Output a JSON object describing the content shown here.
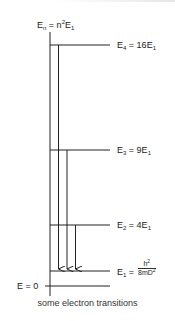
{
  "diagram": {
    "title_formula": {
      "E": "E",
      "sub": "n",
      "eq": " = n",
      "sup": "2",
      "E1": "E",
      "sub1": "1"
    },
    "levels": [
      {
        "id": "E4",
        "label_main": "E",
        "label_sub": "4",
        "label_rest": " = 16E",
        "label_sub2": "1"
      },
      {
        "id": "E3",
        "label_main": "E",
        "label_sub": "3",
        "label_rest": " = 9E",
        "label_sub2": "1"
      },
      {
        "id": "E2",
        "label_main": "E",
        "label_sub": "2",
        "label_rest": " = 4E",
        "label_sub2": "1"
      },
      {
        "id": "E1",
        "label_main": "E",
        "label_sub": "1",
        "label_rest": " =",
        "fraction_num": "h",
        "fraction_num_sup": "2",
        "fraction_den": "8mD",
        "fraction_den_sup": "2"
      }
    ],
    "zero_label": "E = 0",
    "transitions": [
      "E4 → E1",
      "E3 → E1",
      "E2 → E1"
    ],
    "caption": "some electron transitions",
    "line_color": "#222222"
  }
}
